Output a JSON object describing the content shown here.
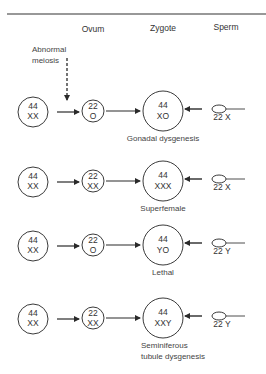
{
  "headers": {
    "ovum": "Ovum",
    "zygote": "Zygote",
    "sperm": "Sperm"
  },
  "annotation": {
    "line1": "Abnormal",
    "line2": "meiosis"
  },
  "rows": [
    {
      "parent": {
        "autosomes": "44",
        "sex": "XX"
      },
      "ovum": {
        "autosomes": "22",
        "sex": "O"
      },
      "zygote": {
        "autosomes": "44",
        "sex": "XO"
      },
      "sperm": "22 X",
      "outcome": [
        "Gonadal dysgenesis"
      ]
    },
    {
      "parent": {
        "autosomes": "44",
        "sex": "XX"
      },
      "ovum": {
        "autosomes": "22",
        "sex": "XX"
      },
      "zygote": {
        "autosomes": "44",
        "sex": "XXX"
      },
      "sperm": "22 X",
      "outcome": [
        "Superfemale"
      ]
    },
    {
      "parent": {
        "autosomes": "44",
        "sex": "XX"
      },
      "ovum": {
        "autosomes": "22",
        "sex": "O"
      },
      "zygote": {
        "autosomes": "44",
        "sex": "YO"
      },
      "sperm": "22 Y",
      "outcome": [
        "Lethal"
      ]
    },
    {
      "parent": {
        "autosomes": "44",
        "sex": "XX"
      },
      "ovum": {
        "autosomes": "22",
        "sex": "XX"
      },
      "zygote": {
        "autosomes": "44",
        "sex": "XXY"
      },
      "sperm": "22 Y",
      "outcome": [
        "Seminiferous",
        "tubule dysgenesis"
      ]
    }
  ]
}
